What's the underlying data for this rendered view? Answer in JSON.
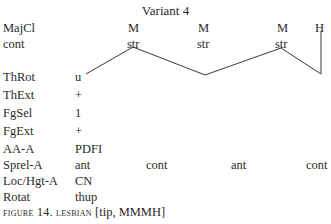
{
  "figure": {
    "title": "Variant 4",
    "rows": [
      {
        "label": "MajCl",
        "values": [
          "M",
          "M",
          "M",
          "H"
        ]
      },
      {
        "label": "cont",
        "values": [
          "str",
          "str",
          "str"
        ]
      },
      {
        "label": "ThRot",
        "value": "u"
      },
      {
        "label": "ThExt",
        "value": "+"
      },
      {
        "label": "FgSel",
        "value": "1"
      },
      {
        "label": "FgExt",
        "value": "+"
      },
      {
        "label": "AA-A",
        "value": "PDFI"
      },
      {
        "label": "Sprel-A",
        "values": [
          "ant",
          "cont",
          "ant",
          "cont"
        ]
      },
      {
        "label": "Loc/Hgt-A",
        "value": "CN"
      },
      {
        "label": "Rotat",
        "value": "thup"
      }
    ],
    "caption": {
      "figure_label": "FIGURE 14.",
      "sign_name": "LESBIAN",
      "rest": "[tip, MMMH]"
    },
    "line_color": "#3a3a3a"
  }
}
